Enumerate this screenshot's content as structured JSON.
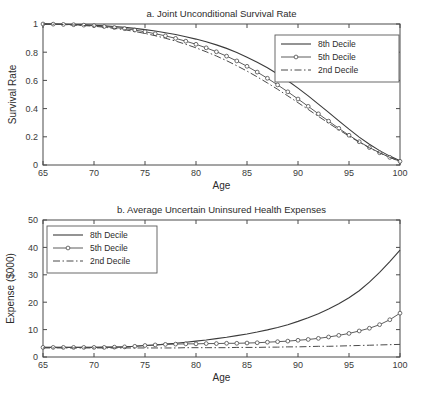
{
  "figure": {
    "background": "#ffffff",
    "line_color": "#3b3b3b"
  },
  "chart_data": [
    {
      "id": "panel-a",
      "type": "line",
      "title": "a. Joint Unconditional Survival Rate",
      "xlabel": "Age",
      "ylabel": "Survival Rate",
      "xlim": [
        65,
        100
      ],
      "ylim": [
        0,
        1
      ],
      "xticks": [
        65,
        70,
        75,
        80,
        85,
        90,
        95,
        100
      ],
      "xtick_labels": [
        "65",
        "70",
        "75",
        "80",
        "85",
        "90",
        "95",
        "100"
      ],
      "yticks": [
        0,
        0.2,
        0.4,
        0.6,
        0.8,
        1
      ],
      "ytick_labels": [
        "0",
        "0.2",
        "0.4",
        "0.6",
        "0.8",
        "1"
      ],
      "grid": false,
      "legend_position": "upper right",
      "x": [
        65,
        66,
        67,
        68,
        69,
        70,
        71,
        72,
        73,
        74,
        75,
        76,
        77,
        78,
        79,
        80,
        81,
        82,
        83,
        84,
        85,
        86,
        87,
        88,
        89,
        90,
        91,
        92,
        93,
        94,
        95,
        96,
        97,
        98,
        99,
        100
      ],
      "series": [
        {
          "name": "8th  Decile",
          "style": "solid",
          "markers": false,
          "values": [
            1.0,
            0.999,
            0.998,
            0.996,
            0.994,
            0.991,
            0.987,
            0.982,
            0.976,
            0.969,
            0.96,
            0.95,
            0.938,
            0.925,
            0.91,
            0.893,
            0.874,
            0.852,
            0.827,
            0.798,
            0.765,
            0.729,
            0.689,
            0.645,
            0.597,
            0.545,
            0.49,
            0.432,
            0.373,
            0.313,
            0.254,
            0.198,
            0.147,
            0.102,
            0.063,
            0.03
          ]
        },
        {
          "name": "5th  Decile",
          "style": "solid",
          "markers": true,
          "values": [
            1.0,
            0.999,
            0.997,
            0.995,
            0.992,
            0.988,
            0.982,
            0.975,
            0.967,
            0.957,
            0.945,
            0.931,
            0.916,
            0.898,
            0.878,
            0.856,
            0.831,
            0.803,
            0.772,
            0.738,
            0.7,
            0.659,
            0.615,
            0.568,
            0.519,
            0.468,
            0.416,
            0.363,
            0.311,
            0.26,
            0.211,
            0.165,
            0.124,
            0.087,
            0.054,
            0.026
          ]
        },
        {
          "name": "2nd Decile",
          "style": "dashdot",
          "markers": false,
          "values": [
            1.0,
            0.998,
            0.996,
            0.993,
            0.989,
            0.984,
            0.977,
            0.969,
            0.959,
            0.947,
            0.933,
            0.917,
            0.899,
            0.879,
            0.856,
            0.831,
            0.803,
            0.773,
            0.74,
            0.704,
            0.666,
            0.625,
            0.582,
            0.537,
            0.49,
            0.442,
            0.394,
            0.345,
            0.297,
            0.25,
            0.205,
            0.162,
            0.122,
            0.086,
            0.054,
            0.025
          ]
        }
      ]
    },
    {
      "id": "panel-b",
      "type": "line",
      "title": "b. Average Uncertain Uninsured Health Expenses",
      "xlabel": "Age",
      "ylabel": "Expense ($000)",
      "xlim": [
        65,
        100
      ],
      "ylim": [
        0,
        50
      ],
      "xticks": [
        65,
        70,
        75,
        80,
        85,
        90,
        95,
        100
      ],
      "xtick_labels": [
        "65",
        "70",
        "75",
        "80",
        "85",
        "90",
        "95",
        "100"
      ],
      "yticks": [
        0,
        10,
        20,
        30,
        40,
        50
      ],
      "ytick_labels": [
        "0",
        "10",
        "20",
        "30",
        "40",
        "50"
      ],
      "grid": false,
      "legend_position": "upper left",
      "x": [
        65,
        66,
        67,
        68,
        69,
        70,
        71,
        72,
        73,
        74,
        75,
        76,
        77,
        78,
        79,
        80,
        81,
        82,
        83,
        84,
        85,
        86,
        87,
        88,
        89,
        90,
        91,
        92,
        93,
        94,
        95,
        96,
        97,
        98,
        99,
        100
      ],
      "series": [
        {
          "name": "8th  Decile",
          "style": "solid",
          "markers": false,
          "values": [
            3.5,
            3.5,
            3.5,
            3.5,
            3.5,
            3.5,
            3.6,
            3.6,
            3.7,
            3.9,
            4.2,
            4.4,
            4.7,
            5.0,
            5.4,
            5.8,
            6.2,
            6.7,
            7.2,
            7.8,
            8.4,
            9.1,
            9.9,
            10.8,
            11.8,
            13.0,
            14.3,
            15.8,
            17.5,
            19.4,
            21.6,
            24.2,
            27.3,
            30.9,
            34.8,
            39.0
          ]
        },
        {
          "name": "5th  Decile",
          "style": "solid",
          "markers": true,
          "values": [
            3.5,
            3.5,
            3.5,
            3.5,
            3.5,
            3.5,
            3.5,
            3.6,
            3.7,
            3.9,
            4.2,
            4.4,
            4.6,
            4.7,
            4.8,
            4.8,
            4.9,
            4.9,
            5.0,
            5.0,
            5.1,
            5.2,
            5.4,
            5.6,
            5.8,
            6.1,
            6.4,
            6.8,
            7.3,
            7.9,
            8.6,
            9.5,
            10.5,
            11.8,
            13.6,
            16.0
          ]
        },
        {
          "name": "2nd Decile",
          "style": "dashdot",
          "markers": false,
          "values": [
            3.3,
            3.3,
            3.3,
            3.3,
            3.3,
            3.3,
            3.3,
            3.3,
            3.3,
            3.3,
            3.3,
            3.3,
            3.3,
            3.3,
            3.4,
            3.4,
            3.4,
            3.4,
            3.4,
            3.5,
            3.5,
            3.5,
            3.6,
            3.6,
            3.7,
            3.7,
            3.8,
            3.9,
            3.9,
            4.0,
            4.1,
            4.2,
            4.3,
            4.4,
            4.5,
            4.6
          ]
        }
      ]
    }
  ]
}
